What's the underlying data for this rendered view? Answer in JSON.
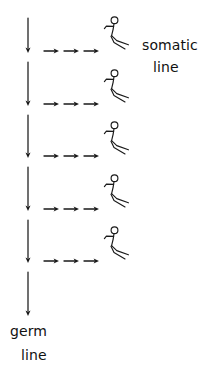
{
  "diagram": {
    "ink_color": "#1a1a1a",
    "background_color": "#ffffff",
    "width": 199,
    "height": 373,
    "labels": {
      "somatic_word": "somatic",
      "somatic_line_word": "line",
      "germ_word": "germ",
      "germ_line_word": "line"
    },
    "germ_line": {
      "name": "germ-line-arrow-column",
      "x": 28,
      "segment_count": 6,
      "arrow_tip_y": [
        52,
        105,
        157,
        210,
        262,
        315
      ],
      "segment_start_y": [
        18,
        62,
        115,
        167,
        220,
        272
      ]
    },
    "somatic_rows": {
      "count": 5,
      "row_y": [
        51,
        104,
        156,
        209,
        261
      ],
      "arrows_per_row": 3,
      "arrow_tip_x": [
        58,
        78,
        98
      ],
      "arrow_tail_x": [
        44,
        64,
        84
      ],
      "figure_x": [
        104,
        104,
        104,
        104,
        104
      ],
      "figure_top_y": [
        16,
        69,
        121,
        174,
        226
      ]
    }
  }
}
